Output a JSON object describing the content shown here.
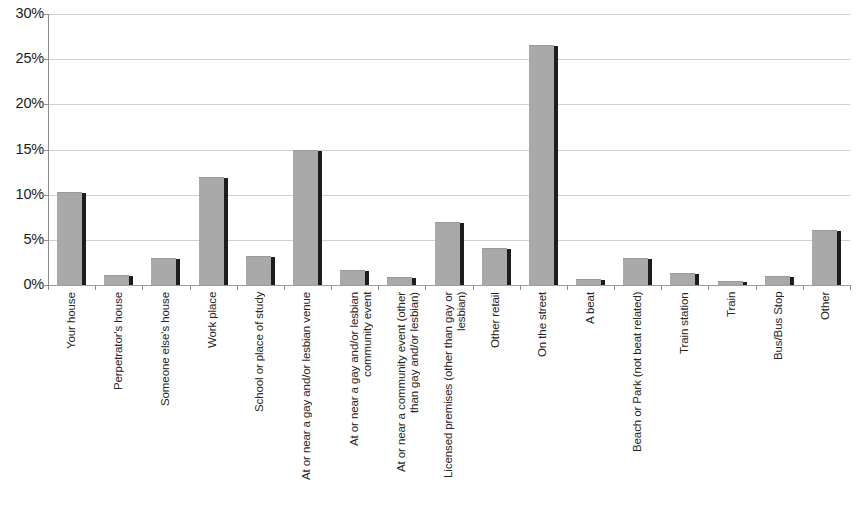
{
  "chart_data": {
    "type": "bar",
    "title": "",
    "xlabel": "",
    "ylabel": "",
    "ylim": [
      0,
      30
    ],
    "ytick_labels": [
      "30%",
      "25%",
      "20%",
      "15%",
      "10%",
      "5%",
      "0%"
    ],
    "ytick_values": [
      30,
      25,
      20,
      15,
      10,
      5,
      0
    ],
    "grid": true,
    "legend": "none",
    "value_format": "percent",
    "categories": [
      "Your house",
      "Perpetrator's house",
      "Someone else's house",
      "Work place",
      "School or place of study",
      "At or near a gay and/or lesbian venue",
      "At or near a gay and/or lesbian\ncommunity event",
      "At or near a community event (other\nthan gay and/or lesbian)",
      "Licensed premises (other than gay or\nlesbian)",
      "Other retail",
      "On the street",
      "A beat",
      "Beach or Park (not beat related)",
      "Train station",
      "Train",
      "Bus/Bus Stop",
      "Other"
    ],
    "values": [
      10.2,
      1.0,
      2.9,
      11.8,
      3.1,
      14.8,
      1.6,
      0.8,
      6.9,
      4.0,
      26.5,
      0.5,
      2.9,
      1.2,
      0.3,
      0.9,
      6.0
    ]
  },
  "style": {
    "bar_color": "#a9a9a9",
    "bar_shadow_color": "#1d1d1d",
    "gridline_color": "#c9c9c9",
    "axis_color": "#8d8d8d",
    "text_color": "#1a1a1a",
    "background": "#ffffff"
  }
}
